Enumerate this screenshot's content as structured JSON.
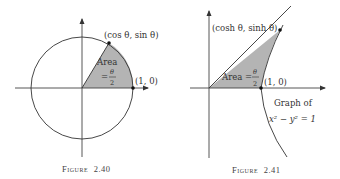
{
  "figures": [
    {
      "id": "2.40",
      "caption_prefix": "Figure",
      "caption_number": "2.40",
      "point_label": "(cos θ, sin θ)",
      "unit_point_label": "(1, 0)",
      "area_label": "Area",
      "area_eq": "=",
      "area_numerator": "θ",
      "area_denominator": "2"
    },
    {
      "id": "2.41",
      "caption_prefix": "Figure",
      "caption_number": "2.41",
      "point_label": "(cosh θ, sinh θ)",
      "unit_point_label": "(1, 0)",
      "area_label": "Area =",
      "area_numerator": "θ",
      "area_denominator": "2",
      "graph_label_line1": "Graph of",
      "graph_label_line2": "x² − y² = 1"
    }
  ],
  "colors": {
    "shade": "#b4b4b4",
    "stroke": "#333333"
  }
}
